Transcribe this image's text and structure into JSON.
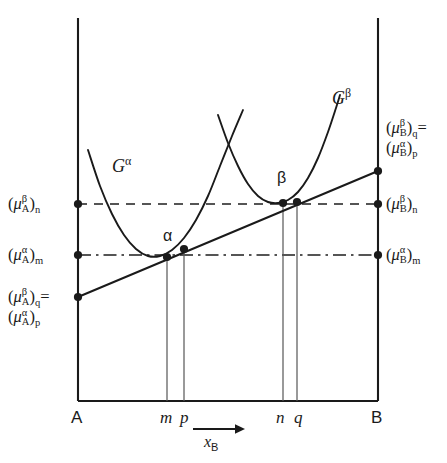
{
  "figure": {
    "type": "thermodynamic-free-energy-diagram"
  },
  "axes": {
    "x_title_symbol": "x",
    "x_title_sub": "B",
    "left_end_label": "A",
    "right_end_label": "B",
    "arrow_icon": "right-arrow-icon"
  },
  "ticks": [
    {
      "id": "m",
      "label": "m",
      "x": 167
    },
    {
      "id": "p",
      "label": "p",
      "x": 184
    },
    {
      "id": "n",
      "label": "n",
      "x": 283
    },
    {
      "id": "q",
      "label": "q",
      "x": 297
    }
  ],
  "curves": [
    {
      "id": "G-alpha",
      "label_base": "G",
      "label_sup": "α"
    },
    {
      "id": "G-beta",
      "label_base": "G",
      "label_sup": "β"
    }
  ],
  "point_labels": [
    {
      "id": "alpha-point",
      "text": "α"
    },
    {
      "id": "beta-point",
      "text": "β"
    }
  ],
  "left_labels": [
    {
      "id": "mu-A-beta-n",
      "lines": [
        {
          "open": "(",
          "mu": "μ",
          "sup": "β",
          "sub": "A",
          "close": ")",
          "post": "n"
        }
      ]
    },
    {
      "id": "mu-A-alpha-m",
      "lines": [
        {
          "open": "(",
          "mu": "μ",
          "sup": "α",
          "sub": "A",
          "close": ")",
          "post": "m"
        }
      ]
    },
    {
      "id": "mu-A-beta-q-equals-mu-A-alpha-p",
      "lines": [
        {
          "open": "(",
          "mu": "μ",
          "sup": "β",
          "sub": "A",
          "close": ")",
          "post": "q",
          "trailing": "="
        },
        {
          "open": "(",
          "mu": "μ",
          "sup": "α",
          "sub": "A",
          "close": ")",
          "post": "p"
        }
      ]
    }
  ],
  "right_labels": [
    {
      "id": "mu-B-beta-q-equals-mu-B-alpha-p",
      "lines": [
        {
          "open": "(",
          "mu": "μ",
          "sup": "β",
          "sub": "B",
          "close": ")",
          "post": "q",
          "trailing": "="
        },
        {
          "open": "(",
          "mu": "μ",
          "sup": "α",
          "sub": "B",
          "close": ")",
          "post": "p"
        }
      ]
    },
    {
      "id": "mu-B-beta-n",
      "lines": [
        {
          "open": "(",
          "mu": "μ",
          "sup": "β",
          "sub": "B",
          "close": ")",
          "post": "n"
        }
      ]
    },
    {
      "id": "mu-B-alpha-m",
      "lines": [
        {
          "open": "(",
          "mu": "μ",
          "sup": "α",
          "sub": "B",
          "close": ")",
          "post": "m"
        }
      ]
    }
  ],
  "chart_data": {
    "type": "line",
    "title": "",
    "xlabel": "x_B",
    "ylabel": "",
    "xlim": [
      0,
      1
    ],
    "grid": false,
    "legend_position": "inline-curve-labels",
    "frame": {
      "left": 78,
      "right": 378,
      "top": 18,
      "bottom": 401
    },
    "horizontal_levels": [
      {
        "id": "n-level",
        "label": "n",
        "y": 204,
        "style": "dashed",
        "left_label": "(μ^β_A)_n",
        "right_label": "(μ^β_B)_n"
      },
      {
        "id": "m-level",
        "label": "m",
        "y": 255,
        "style": "dash-dot",
        "left_label": "(μ^α_A)_m",
        "right_label": "(μ^α_B)_m"
      }
    ],
    "vertical_drop_lines": [
      {
        "id": "m",
        "x": 167,
        "y_top": 257,
        "y_bottom": 401
      },
      {
        "id": "p",
        "x": 184,
        "y_top": 249,
        "y_bottom": 401
      },
      {
        "id": "n",
        "x": 283,
        "y_top": 203,
        "y_bottom": 401
      },
      {
        "id": "q",
        "x": 297,
        "y_top": 202,
        "y_bottom": 401
      }
    ],
    "series": [
      {
        "name": "G^α",
        "style": "solid-curve",
        "points": [
          [
            88,
            150
          ],
          [
            100,
            186
          ],
          [
            112,
            214
          ],
          [
            124,
            235
          ],
          [
            136,
            249
          ],
          [
            148,
            256
          ],
          [
            160,
            256
          ],
          [
            172,
            250
          ],
          [
            184,
            238
          ],
          [
            196,
            220
          ],
          [
            208,
            196
          ],
          [
            220,
            166
          ],
          [
            232,
            136
          ],
          [
            243,
            110
          ]
        ]
      },
      {
        "name": "G^β",
        "style": "solid-curve",
        "points": [
          [
            218,
            115
          ],
          [
            228,
            143
          ],
          [
            238,
            166
          ],
          [
            248,
            184
          ],
          [
            258,
            196
          ],
          [
            268,
            202
          ],
          [
            278,
            203
          ],
          [
            288,
            200
          ],
          [
            298,
            192
          ],
          [
            308,
            178
          ],
          [
            318,
            158
          ],
          [
            328,
            132
          ],
          [
            336,
            108
          ],
          [
            340,
            95
          ]
        ]
      },
      {
        "name": "common-tangent",
        "style": "straight-line",
        "points": [
          [
            78,
            297
          ],
          [
            378,
            171
          ]
        ]
      }
    ],
    "marker_points": [
      {
        "id": "tangent-left-endpoint",
        "x": 78,
        "y": 297
      },
      {
        "id": "alpha-tangency-m",
        "x": 167,
        "y": 257
      },
      {
        "id": "alpha-tangency-p",
        "x": 184,
        "y": 249
      },
      {
        "id": "beta-tangency-n",
        "x": 283,
        "y": 203
      },
      {
        "id": "beta-tangency-q",
        "x": 297,
        "y": 202
      },
      {
        "id": "tangent-right-endpoint",
        "x": 378,
        "y": 171
      },
      {
        "id": "left-axis-n-level",
        "x": 78,
        "y": 204
      },
      {
        "id": "left-axis-m-level",
        "x": 78,
        "y": 255
      },
      {
        "id": "right-axis-n-level",
        "x": 378,
        "y": 204
      },
      {
        "id": "right-axis-m-level",
        "x": 378,
        "y": 255
      }
    ]
  }
}
